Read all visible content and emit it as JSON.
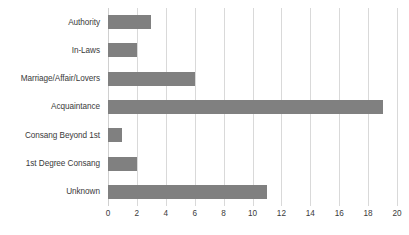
{
  "chart_data": {
    "type": "bar",
    "orientation": "horizontal",
    "title": "",
    "xlabel": "",
    "ylabel": "",
    "categories": [
      "Authority",
      "In-Laws",
      "Marriage/Affair/Lovers",
      "Acquaintance",
      "Consang Beyond 1st",
      "1st Degree Consang",
      "Unknown"
    ],
    "values": [
      3,
      2,
      6,
      19,
      1,
      2,
      11
    ],
    "xlim": [
      0,
      20
    ],
    "xticks": [
      0,
      2,
      4,
      6,
      8,
      10,
      12,
      14,
      16,
      18,
      20
    ],
    "xtick_labels": [
      "0",
      "2",
      "4",
      "6",
      "8",
      "10",
      "12",
      "14",
      "16",
      "18",
      "20"
    ],
    "grid": "vertical",
    "legend": "none",
    "colors": {
      "bar": "#808080",
      "gridline": "#D9D9D9",
      "text": "#3A3A3A",
      "background": "#FFFFFF"
    }
  }
}
